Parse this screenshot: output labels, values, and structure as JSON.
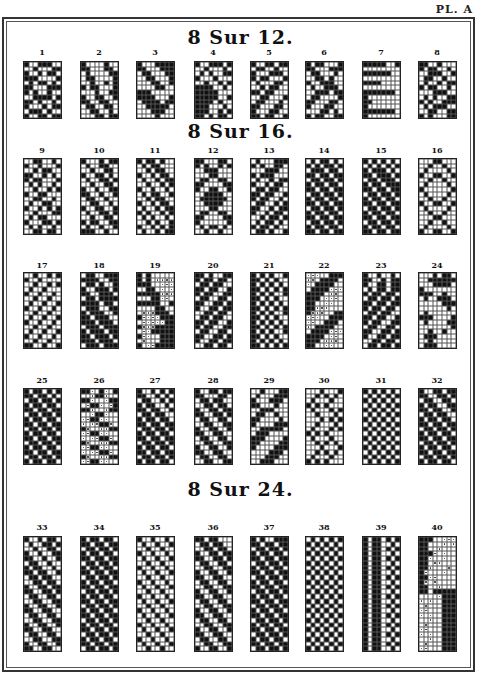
{
  "plate_label": "PL. A",
  "sections": [
    {
      "title": "8 Sur 12.",
      "rows": 12
    },
    {
      "title": "8 Sur 16.",
      "rows": 16
    },
    {
      "title": "8 Sur 24.",
      "rows": 24
    }
  ],
  "patterns": [
    {
      "num": "1",
      "section": 0,
      "cells": [
        "10011100",
        "00100011",
        "10010110",
        "11100001",
        "01011010",
        "11000111",
        "10100100",
        "00111101",
        "11010010",
        "10001011",
        "01110100",
        "10011011"
      ]
    },
    {
      "num": "2",
      "section": 0,
      "cells": [
        "10000100",
        "11000110",
        "01000011",
        "01100001",
        "00100101",
        "10110001",
        "00010011",
        "10011001",
        "11001100",
        "01100110",
        "00110010",
        "00011011"
      ]
    },
    {
      "num": "3",
      "section": 0,
      "cells": [
        "10001111",
        "11000111",
        "01100011",
        "00110001",
        "00011001",
        "00001100",
        "11100000",
        "11110001",
        "01111011",
        "00111110",
        "00011100",
        "00001000"
      ]
    },
    {
      "num": "4",
      "section": 0,
      "cells": [
        "10011101",
        "00100010",
        "01010011",
        "10001000",
        "00100101",
        "11110010",
        "11111000",
        "11111001",
        "11110100",
        "11100010",
        "11100101",
        "11010110"
      ]
    },
    {
      "num": "5",
      "section": 0,
      "cells": [
        "10011011",
        "01100100",
        "10001110",
        "10110001",
        "01000110",
        "00101100",
        "11011000",
        "00110001",
        "01100010",
        "11000110",
        "10001100",
        "11011001"
      ]
    },
    {
      "num": "6",
      "section": 0,
      "cells": [
        "10110001",
        "11000111",
        "01100010",
        "00110100",
        "10011100",
        "01001110",
        "00111011",
        "01100001",
        "11000110",
        "10001100",
        "00011010",
        "10110011"
      ]
    },
    {
      "num": "7",
      "section": 0,
      "cells": [
        "11111001",
        "00000000",
        "11111100",
        "00000000",
        "11110000",
        "00000000",
        "11111110",
        "10000000",
        "11000000",
        "10000000",
        "11111110",
        "10000000"
      ]
    },
    {
      "num": "8",
      "section": 0,
      "cells": [
        "11001000",
        "10110010",
        "00111001",
        "01100100",
        "01001011",
        "10110010",
        "00011100",
        "01010011",
        "10100111",
        "01011100",
        "00110011",
        "10100011"
      ]
    },
    {
      "num": "9",
      "section": 1,
      "cells": [
        "00110010",
        "10010001",
        "00101100",
        "11001010",
        "10110001",
        "01010010",
        "00100101",
        "10011000",
        "00110010",
        "01001100",
        "10010101",
        "00100011",
        "01011000",
        "10001101",
        "01010010",
        "00110110"
      ]
    },
    {
      "num": "10",
      "section": 1,
      "cells": [
        "10001011",
        "01001100",
        "00100110",
        "10011010",
        "01001101",
        "00100110",
        "10010011",
        "11001001",
        "01100100",
        "00110010",
        "10011001",
        "01001101",
        "00100110",
        "10110011",
        "01001001",
        "11100100"
      ]
    },
    {
      "num": "11",
      "section": 1,
      "cells": [
        "10110100",
        "01011000",
        "00101100",
        "10010110",
        "01001011",
        "00100101",
        "10010010",
        "01011001",
        "00101100",
        "10010110",
        "01001011",
        "10100101",
        "01010010",
        "00101001",
        "10010101",
        "01001011"
      ]
    },
    {
      "num": "12",
      "section": 1,
      "cells": [
        "11000110",
        "10100101",
        "00111000",
        "00011000",
        "01100110",
        "11000011",
        "10011001",
        "00111100",
        "01111110",
        "00111100",
        "00011000",
        "01100110",
        "11000011",
        "10000001",
        "01011010",
        "00100100"
      ]
    },
    {
      "num": "13",
      "section": 1,
      "cells": [
        "01000111",
        "10100110",
        "00011100",
        "10111000",
        "01001011",
        "10010110",
        "01101100",
        "11011001",
        "10110010",
        "01100101",
        "11001011",
        "10010110",
        "00101101",
        "01011010",
        "10110100",
        "01101001"
      ]
    },
    {
      "num": "14",
      "section": 1,
      "cells": [
        "01011010",
        "10101101",
        "01110110",
        "11011011",
        "01101101",
        "10110110",
        "11011011",
        "01101101",
        "10110110",
        "11011011",
        "01101101",
        "10110110",
        "11011011",
        "01101101",
        "10110110",
        "11011011"
      ]
    },
    {
      "num": "15",
      "section": 1,
      "cells": [
        "10101010",
        "01010101",
        "10111010",
        "11011101",
        "01101110",
        "10110111",
        "11011011",
        "01101101",
        "10110110",
        "11011011",
        "01101101",
        "10110110",
        "11011011",
        "01101101",
        "10110110",
        "11011011"
      ]
    },
    {
      "num": "16",
      "section": 1,
      "cells": [
        "00011000",
        "00100100",
        "01000010",
        "10011001",
        "00100100",
        "01000010",
        "10000001",
        "01000010",
        "00100100",
        "10011001",
        "01000010",
        "00100100",
        "00011000",
        "00100100",
        "01000010",
        "10011001"
      ]
    },
    {
      "num": "17",
      "section": 1,
      "cells": [
        "00100101",
        "10010000",
        "00100101",
        "01001000",
        "10010010",
        "00100100",
        "01001001",
        "10010010",
        "00100100",
        "01001001",
        "10010010",
        "00100100",
        "01001001",
        "10010010",
        "00100100",
        "11001001"
      ]
    },
    {
      "num": "18",
      "section": 1,
      "cells": [
        "01100111",
        "11110011",
        "01101001",
        "10011101",
        "11001110",
        "01101111",
        "11110110",
        "01110011",
        "10111001",
        "11011100",
        "11101110",
        "01110111",
        "10111011",
        "11011101",
        "11101110",
        "01110111"
      ]
    },
    {
      "num": "19",
      "section": 1,
      "cells": [
        "10100000",
        "1010....",
        "11100...",
        "00110.0.",
        "11111...",
        "00011..0",
        "11111001",
        "00001100",
        "0...1110",
        "1....111",
        "0.....11",
        "1...1111",
        "0..11111",
        "1..00111",
        "0.0001111",
        "10..1111"
      ]
    },
    {
      "num": "20",
      "section": 1,
      "cells": [
        "11010011",
        "10110110",
        "01101100",
        "11011001",
        "10110011",
        "01100110",
        "11001101",
        "10011011",
        "00110110",
        "01101100",
        "11011001",
        "10110011",
        "01100110",
        "11001101",
        "10011011",
        "00110110"
      ]
    },
    {
      "num": "21",
      "section": 1,
      "cells": [
        "10101001",
        "11010100",
        "10101010",
        "11010101",
        "10101001",
        "11010100",
        "10101010",
        "11010101",
        "10101001",
        "11010100",
        "10101010",
        "11010101",
        "10101001",
        "11010100",
        "10101010",
        "11010101"
      ]
    },
    {
      "num": "22",
      "section": 1,
      "cells": [
        "...00111",
        "..011110",
        ".0111100",
        "01111...",
        "11110..0",
        "1110...0",
        "1100..00",
        "11...000",
        "1...0011",
        "...00111",
        "..001110",
        ".0111100",
        "01111...",
        "11110..0",
        "1110...0",
        "1100..00"
      ]
    },
    {
      "num": "23",
      "section": 1,
      "cells": [
        "10010010",
        "11001011",
        "10011011",
        "01011011",
        "10110110",
        "01101101",
        "11011011",
        "10110110",
        "01101100",
        "11011001",
        "10110011",
        "01100110",
        "11001101",
        "10011011",
        "00110110",
        "01101101"
      ]
    },
    {
      "num": "24",
      "section": 1,
      "cells": [
        "00010110",
        "00111111",
        "00011110",
        "10000000",
        "11100100",
        "01001110",
        "00000111",
        "00000010",
        "01000000",
        "11100001",
        "01000011",
        "00000001",
        "00100100",
        "01110000",
        "00100000",
        "01110000"
      ]
    },
    {
      "num": "25",
      "section": 1,
      "cells": [
        "10110101",
        "11011010",
        "01101101",
        "10110110",
        "11011011",
        "01101101",
        "10110110",
        "11011011",
        "01101101",
        "10110110",
        "11011011",
        "01101101",
        "10110110",
        "11011011",
        "01101101",
        "10110110"
      ]
    },
    {
      "num": "26",
      "section": 1,
      "cells": [
        "11.01.01",
        "00.11.00",
        "11.00.11",
        "0.11.0.1",
        "11.00.11",
        "00.11.00",
        "..11..00",
        ".0..11.0",
        "1.00..11",
        "..11..00",
        ".0..11.0",
        "1.00..11",
        "..11..00",
        ".0..11.0",
        "1.00..11",
        "..11..00"
      ]
    },
    {
      "num": "27",
      "section": 1,
      "cells": [
        "10010101",
        "11001010",
        "01100101",
        "10110010",
        "11011001",
        "01101100",
        "10110110",
        "11011011",
        "01101101",
        "10110110",
        "11011011",
        "01101101",
        "10110110",
        "11011011",
        "01101101",
        "10110110"
      ]
    },
    {
      "num": "28",
      "section": 1,
      "cells": [
        "10011011",
        "11000110",
        "01101100",
        "00110110",
        "10011011",
        "11001101",
        "01100110",
        "00110011",
        "10011001",
        "11001100",
        "01100110",
        "00110011",
        "10011001",
        "11001100",
        "01100110",
        "00110011"
      ]
    },
    {
      "num": "29",
      "section": 1,
      "cells": [
        "00100011",
        "01000111",
        "10001110",
        "11000100",
        "00111000",
        "01100100",
        "11000010",
        "10000111",
        "00111110",
        "01110000",
        "11100001",
        "11000011",
        "10000111",
        "00001110",
        "00011100",
        "00111000"
      ]
    },
    {
      "num": "30",
      "section": 1,
      "cells": [
        "00010001",
        "00101010",
        "01000100",
        "10101000",
        "01000101",
        "00100010",
        "00010101",
        "00100010",
        "01000101",
        "10101000",
        "01000100",
        "00101010",
        "00010001",
        "00101010",
        "01000100",
        "10101000"
      ]
    },
    {
      "num": "31",
      "section": 1,
      "cells": [
        "10101010",
        "01010101",
        "10101010",
        "01010101",
        "10101010",
        "01010101",
        "10101010",
        "01010101",
        "10101010",
        "01010101",
        "10101010",
        "01010101",
        "10101010",
        "01010101",
        "10101010",
        "01010101"
      ]
    },
    {
      "num": "32",
      "section": 1,
      "cells": [
        "10011011",
        "11001101",
        "01100110",
        "10110011",
        "11011001",
        "01101100",
        "10110110",
        "11011011",
        "01101101",
        "10110110",
        "11011011",
        "01101101",
        "10110110",
        "11011011",
        "01101101",
        "10110110"
      ]
    },
    {
      "num": "33",
      "section": 2,
      "cells": [
        "10010110",
        "01001101",
        "00100110",
        "10010011",
        "11001001",
        "01100100",
        "10110010",
        "11011001",
        "01101100",
        "00110110",
        "10011011",
        "11001101",
        "01100110",
        "00110011",
        "10011001",
        "11001100",
        "01100110",
        "00110011",
        "10011001",
        "11001100",
        "01100110",
        "00110011",
        "10011001",
        "11001100"
      ]
    },
    {
      "num": "34",
      "section": 2,
      "cells": [
        "10110110",
        "11011011",
        "01101101",
        "10110110",
        "11011011",
        "01101101",
        "10110110",
        "11011011",
        "01101101",
        "10110110",
        "11011011",
        "01101101",
        "10110110",
        "11011011",
        "01101101",
        "10110110",
        "11011011",
        "01101101",
        "10110110",
        "11011011",
        "01101101",
        "10110110",
        "11011011",
        "01101101"
      ]
    },
    {
      "num": "35",
      "section": 2,
      "cells": [
        "10010010",
        "01001001",
        "00100100",
        "10010010",
        "01001001",
        "00100100",
        "10010010",
        "01001001",
        "00100100",
        "10010010",
        "01001001",
        "00100100",
        "10010010",
        "01001001",
        "00100100",
        "10010010",
        "01001001",
        "00100100",
        "10010010",
        "01001001",
        "00100100",
        "10010010",
        "01001001",
        "00100100"
      ]
    },
    {
      "num": "36",
      "section": 2,
      "cells": [
        "11011000",
        "01101100",
        "00110110",
        "10011011",
        "11001101",
        "01100110",
        "00110011",
        "10011001",
        "11001100",
        "01100110",
        "00110011",
        "10011001",
        "11001100",
        "01100110",
        "00110011",
        "10011001",
        "11001100",
        "01100110",
        "00110011",
        "10011001",
        "11001100",
        "01100110",
        "00110011",
        "10011001"
      ]
    },
    {
      "num": "37",
      "section": 2,
      "cells": [
        "10100111",
        "11011011",
        "01101101",
        "10110110",
        "11011011",
        "01101101",
        "10110110",
        "11011011",
        "01101101",
        "10110110",
        "11011011",
        "01101101",
        "10110110",
        "11011011",
        "01101101",
        "10110110",
        "11011011",
        "01101101",
        "10110110",
        "11011011",
        "01101101",
        "10110110",
        "11011011",
        "01101101"
      ]
    },
    {
      "num": "38",
      "section": 2,
      "cells": [
        "01010101",
        "10101010",
        "01010101",
        "10101010",
        "01010101",
        "10101010",
        "01010101",
        "10101010",
        "01010101",
        "10101010",
        "01010101",
        "10101010",
        "01010101",
        "10101010",
        "01010101",
        "10101010",
        "01010101",
        "10101010",
        "01010101",
        "10101010",
        "01010101",
        "10101010",
        "01010101",
        "10101010"
      ]
    },
    {
      "num": "39",
      "section": 2,
      "cells": [
        "10110101",
        "10110010",
        "10110101",
        "10110010",
        "10110101",
        "10110010",
        "10110101",
        "10110010",
        "10110101",
        "10110010",
        "10110101",
        "10110010",
        "10110101",
        "10110010",
        "10110101",
        "10110010",
        "10110101",
        "10110010",
        "10110101",
        "10110010",
        "10110101",
        "10110010",
        "10110101",
        "10110010"
      ]
    },
    {
      "num": "40",
      "section": 2,
      "cells": [
        "11100...",
        "11000.0.",
        "1100.000",
        "111.0.00",
        "11.00.00",
        "110..000",
        "11.000.0",
        "1.000.00",
        "11..0000",
        "1.0.0000",
        "1100.000",
        "11011111",
        "0000.111",
        ".0.00111",
        "0.000111",
        "..000111",
        ".0.00111",
        "00.00111",
        "0.000111",
        "..000111",
        ".0.00111",
        "00.00111",
        "0.000111",
        "..000111"
      ]
    }
  ]
}
